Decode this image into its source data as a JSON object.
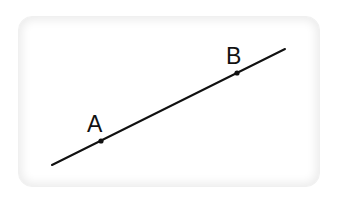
{
  "figure": {
    "colors": {
      "line": "#111111",
      "card_border": "#e6e6e6",
      "background": "#ffffff"
    },
    "line": {
      "x1": 52,
      "y1": 165,
      "x2": 285,
      "y2": 49
    },
    "points": [
      {
        "label": "A",
        "x": 101,
        "y": 141,
        "label_x": 87,
        "label_y": 132
      },
      {
        "label": "B",
        "x": 237,
        "y": 73,
        "label_x": 226,
        "label_y": 64
      }
    ]
  }
}
